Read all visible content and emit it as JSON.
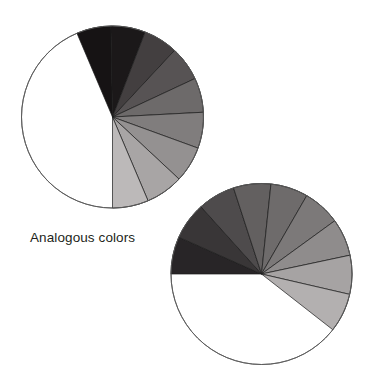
{
  "page": {
    "background_color": "#ffffff",
    "width": 371,
    "height": 391
  },
  "caption": {
    "text": "Analogous colors",
    "color": "#231f20"
  },
  "chart_data": [
    {
      "type": "pie",
      "name": "top-pie",
      "title": "",
      "subtitle": "",
      "xlabel": "",
      "ylabel": "",
      "legend_position": "none",
      "grid": false,
      "center": {
        "x": 112.5,
        "y": 117.0
      },
      "radius": 91.0,
      "outline_color": "#5a5a5a",
      "outline_width": 0.9,
      "slice_border_color": "#1a1a1a",
      "slice_border_width": 0.7,
      "start_angle_deg": -113,
      "sweep_total_deg": 203,
      "unfilled_sweep_deg": 157,
      "categories": [
        "wedge-1",
        "wedge-2",
        "wedge-3",
        "wedge-4",
        "wedge-5",
        "wedge-6",
        "wedge-7",
        "wedge-8",
        "wedge-9"
      ],
      "values": [
        22,
        22,
        22,
        22,
        22,
        23,
        23,
        24,
        23
      ],
      "slices": [
        {
          "label": "wedge-1",
          "start_deg": -113,
          "end_deg": -91,
          "color": "#161314"
        },
        {
          "label": "wedge-2",
          "start_deg": -91,
          "end_deg": -69,
          "color": "#1b1819"
        },
        {
          "label": "wedge-3",
          "start_deg": -69,
          "end_deg": -47,
          "color": "#433f40"
        },
        {
          "label": "wedge-4",
          "start_deg": -47,
          "end_deg": -25,
          "color": "#575354"
        },
        {
          "label": "wedge-5",
          "start_deg": -25,
          "end_deg": -3,
          "color": "#6d6a6a"
        },
        {
          "label": "wedge-6",
          "start_deg": -3,
          "end_deg": 20,
          "color": "#807d7d"
        },
        {
          "label": "wedge-7",
          "start_deg": 20,
          "end_deg": 43,
          "color": "#949191"
        },
        {
          "label": "wedge-8",
          "start_deg": 43,
          "end_deg": 67,
          "color": "#a8a5a5"
        },
        {
          "label": "wedge-9",
          "start_deg": 67,
          "end_deg": 90,
          "color": "#bcb9b9"
        }
      ]
    },
    {
      "type": "pie",
      "name": "bottom-pie",
      "title": "",
      "subtitle": "",
      "xlabel": "",
      "ylabel": "",
      "legend_position": "none",
      "grid": false,
      "center": {
        "x": 261.5,
        "y": 274.0
      },
      "radius": 90.5,
      "outline_color": "#5a5a5a",
      "outline_width": 0.9,
      "slice_border_color": "#1a1a1a",
      "slice_border_width": 0.7,
      "start_angle_deg": 180,
      "sweep_total_deg": 218,
      "unfilled_sweep_deg": 142,
      "categories": [
        "wedge-1",
        "wedge-2",
        "wedge-3",
        "wedge-4",
        "wedge-5",
        "wedge-6",
        "wedge-7",
        "wedge-8",
        "wedge-9"
      ],
      "values": [
        24,
        24,
        24,
        24,
        24,
        24,
        24,
        25,
        25
      ],
      "slices": [
        {
          "label": "wedge-1",
          "start_deg": 180,
          "end_deg": 204,
          "color": "#282527"
        },
        {
          "label": "wedge-2",
          "start_deg": 204,
          "end_deg": 228,
          "color": "#393637"
        },
        {
          "label": "wedge-3",
          "start_deg": 228,
          "end_deg": 252,
          "color": "#4e4b4c"
        },
        {
          "label": "wedge-4",
          "start_deg": 252,
          "end_deg": 276,
          "color": "#636060"
        },
        {
          "label": "wedge-5",
          "start_deg": 276,
          "end_deg": 300,
          "color": "#6e6b6b"
        },
        {
          "label": "wedge-6",
          "start_deg": 300,
          "end_deg": 324,
          "color": "#7c7979"
        },
        {
          "label": "wedge-7",
          "start_deg": 324,
          "end_deg": 348,
          "color": "#8f8c8c"
        },
        {
          "label": "wedge-8",
          "start_deg": 348,
          "end_deg": 373,
          "color": "#a6a3a3"
        },
        {
          "label": "wedge-9",
          "start_deg": 373,
          "end_deg": 398,
          "color": "#b3b0b0"
        }
      ]
    }
  ]
}
